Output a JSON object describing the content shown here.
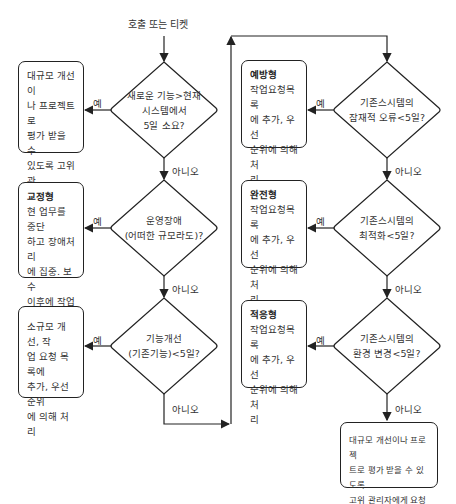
{
  "start": "호출 또는 티켓",
  "labels": {
    "yes": "예",
    "no": "아니오"
  },
  "left_column": {
    "decisions": [
      {
        "text": [
          "새로운 기능>현재",
          "시스템에서",
          "5일 소요?"
        ]
      },
      {
        "text": [
          "운영장애",
          "(어떠한 규모라도)?"
        ]
      },
      {
        "text": [
          "기능개선",
          "(기존기능)<5일?"
        ]
      }
    ],
    "actions": [
      {
        "title": "",
        "lines": [
          "대규모 개선이",
          "나 프로젝트로",
          "평가 받을 수",
          "있도록 고위 관",
          "리자에게 요청"
        ]
      },
      {
        "title": "교정형",
        "lines": [
          "현 업무를 중단",
          "하고 장애처리",
          "에 집중. 보수",
          "이후에 작업목",
          "록에 추가"
        ]
      },
      {
        "title": "",
        "lines": [
          "소규모 개선, 작",
          "업 요청 목록에",
          "추가, 우선 순위",
          "에 의해 처리"
        ]
      }
    ]
  },
  "right_column": {
    "decisions": [
      {
        "text": [
          "기존스시템의",
          "잠재적 오류<5일?"
        ]
      },
      {
        "text": [
          "기존스시템의",
          "최적화<5일?"
        ]
      },
      {
        "text": [
          "기존스시템의",
          "환경 변경<5일?"
        ]
      }
    ],
    "actions": [
      {
        "title": "예방형",
        "lines": [
          "작업요청목록",
          "에 추가, 우선",
          "순위에 의해 처",
          "리"
        ]
      },
      {
        "title": "완전형",
        "lines": [
          "작업요청목록",
          "에 추가, 우선",
          "순위에 의해 처",
          "리"
        ]
      },
      {
        "title": "적응형",
        "lines": [
          "작업요청목록",
          "에 추가, 우선",
          "순위에 의해 처",
          "리"
        ]
      }
    ],
    "final": {
      "lines": [
        "대규모 개선이나 프로젝",
        "트로 평가 받을 수 있도록",
        "고위 관리자에게 요청"
      ]
    }
  }
}
